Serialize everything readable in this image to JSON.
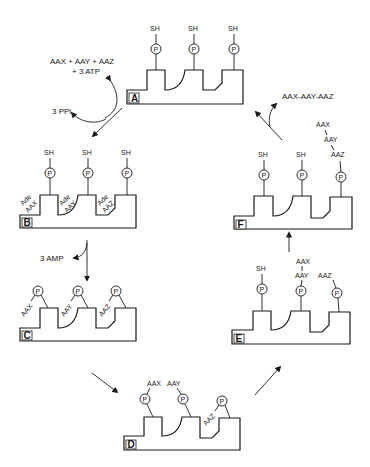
{
  "diagram": {
    "stages": [
      {
        "id": "A",
        "label": "A",
        "groups": [
          "SH",
          "SH",
          "SH"
        ]
      },
      {
        "id": "B",
        "label": "B",
        "groups": [
          "SH",
          "SH",
          "SH"
        ],
        "pocket_labels": [
          [
            "Ade",
            "AAX"
          ],
          [
            "Ade",
            "AAY"
          ],
          [
            "Ade",
            "AAZ"
          ]
        ]
      },
      {
        "id": "C",
        "label": "C",
        "bound": [
          "AAX",
          "AAY",
          "AAZ"
        ]
      },
      {
        "id": "D",
        "label": "D",
        "bound": [
          "AAX",
          "AAY",
          "AAZ"
        ]
      },
      {
        "id": "E",
        "label": "E",
        "groups": [
          "SH"
        ],
        "chain": [
          "AAX",
          "AAY",
          "AAZ"
        ]
      },
      {
        "id": "F",
        "label": "F",
        "groups": [
          "SH",
          "SH"
        ],
        "chain": [
          "AAX",
          "AAY",
          "AAZ"
        ]
      }
    ],
    "phosphopantetheine_symbol": "P",
    "reactions": {
      "a_to_b_input_line1": "AAX + AAY + AAZ",
      "a_to_b_input_line2": "+ 3 ATP",
      "a_to_b_output": "3 PPi",
      "b_to_c_output": "3 AMP",
      "f_to_a_output": "AAX-AAY-AAZ"
    }
  }
}
